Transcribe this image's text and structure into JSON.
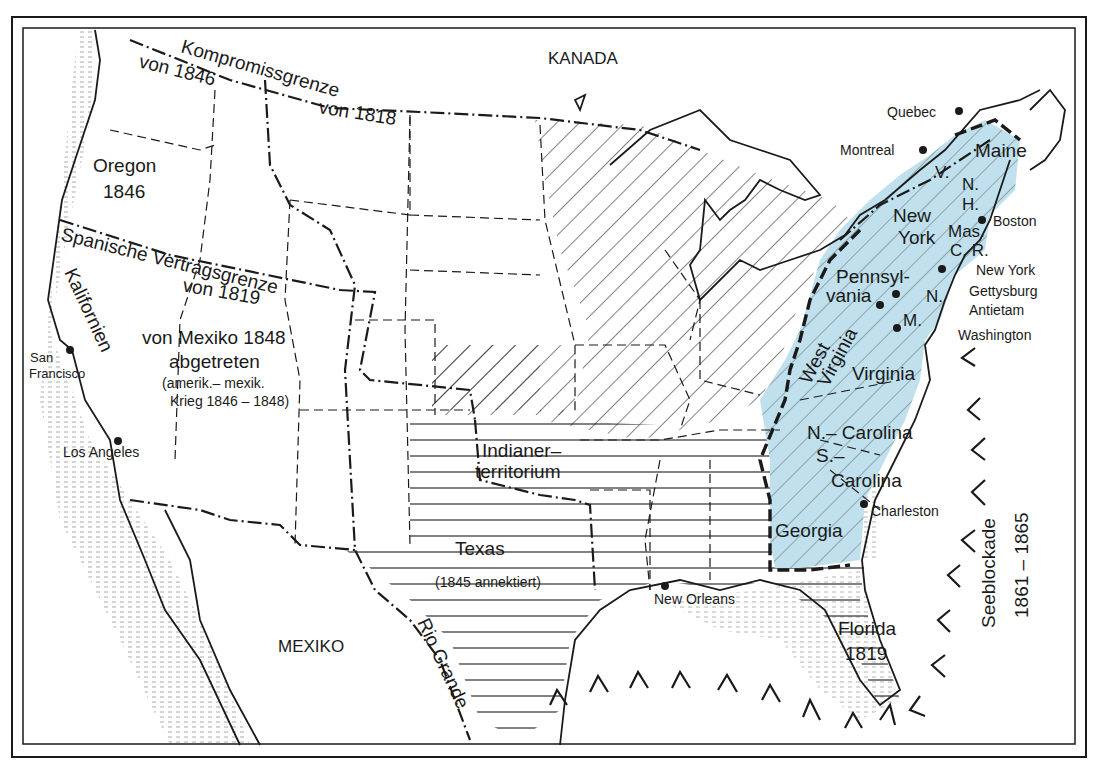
{
  "map": {
    "colors": {
      "confederacy_fill": "#bfe0ec",
      "line": "#1a1a1a",
      "background": "#ffffff"
    },
    "countries": {
      "north": "KANADA",
      "south": "MEXIKO"
    },
    "boundaries": {
      "compromise_1818_line1": "Kompromissgrenze",
      "compromise_1818_line2": "von 1818",
      "compromise_1846": "von 1846",
      "spanish_treaty_line1": "Spanische Vertragsgrenze",
      "spanish_treaty_line2": "von 1819"
    },
    "regions": {
      "oregon_name": "Oregon",
      "oregon_year": "1846",
      "california": "Kalifornien",
      "mexican_cession_line1": "von Mexiko 1848",
      "mexican_cession_line2": "abgetreten",
      "mexican_cession_line3": "(amerik.– mexik.",
      "mexican_cession_line4": "Krieg 1846 – 1848)",
      "indian_territory_line1": "Indianer–",
      "indian_territory_line2": "territorium",
      "texas_name": "Texas",
      "texas_note": "(1845 annektiert)",
      "florida_name": "Florida",
      "florida_year": "1819",
      "rio_grande": "Rio Grande"
    },
    "states": {
      "maine": "Maine",
      "vermont": "V.",
      "new_hampshire_1": "N.",
      "new_hampshire_2": "H.",
      "new_york_1": "New",
      "new_york_2": "York",
      "massachusetts": "Mas.",
      "connecticut_ri": "C. R.",
      "pennsylvania_1": "Pennsyl-",
      "pennsylvania_2": "vania",
      "new_jersey": "N.",
      "maryland": "M.",
      "west_virginia_1": "West",
      "west_virginia_2": "Virginia",
      "virginia": "Virginia",
      "north_carolina": "N.– Carolina",
      "south_carolina_1": "S.–",
      "south_carolina_2": "Carolina",
      "georgia": "Georgia"
    },
    "cities": [
      {
        "name": "Quebec"
      },
      {
        "name": "Montreal"
      },
      {
        "name": "Boston"
      },
      {
        "name": "New York"
      },
      {
        "name": "Gettysburg"
      },
      {
        "name": "Antietam"
      },
      {
        "name": "Washington"
      },
      {
        "name": "Charleston"
      },
      {
        "name": "New Orleans"
      },
      {
        "name": "San Francisco",
        "line1": "San",
        "line2": "Francisco"
      },
      {
        "name": "Los Angeles"
      }
    ],
    "blockade": {
      "label": "Seeblockade",
      "years": "1861 – 1865",
      "marker_icon": "chevron-blockade-icon"
    }
  }
}
